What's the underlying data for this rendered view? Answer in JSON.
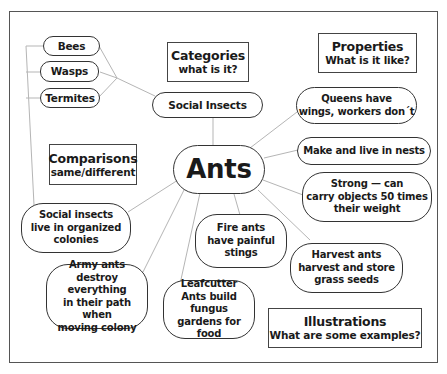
{
  "title": "Ants",
  "category_box": {
    "title": "Categories",
    "subtitle": "what is it?"
  },
  "properties_box": {
    "title": "Properties",
    "subtitle": "What is it like?"
  },
  "comparisons_box": {
    "title": "Comparisons",
    "subtitle": "same/different"
  },
  "illustrations_box": {
    "title": "Illustrations",
    "subtitle": "What are some examples?"
  },
  "category": "Social  Insects",
  "related_insects": [
    "Bees",
    "Wasps",
    "Termites"
  ],
  "properties": [
    [
      "Queens have",
      "wings, workers don´t"
    ],
    [
      "Make and live in nests"
    ],
    [
      "Strong — can",
      "carry objects 50 times",
      "their weight"
    ]
  ],
  "comparison": [
    "Social insects",
    "live in organized",
    "colonies"
  ],
  "illustrations": {
    "army": [
      "Army ants",
      "destroy everything",
      "in their path when",
      "moving colony"
    ],
    "leafcutter": [
      "Leafcutter",
      "Ants build fungus",
      "gardens for food"
    ],
    "fire": [
      "Fire ants",
      "have painful",
      "stings"
    ],
    "harvest": [
      "Harvest ants",
      "harvest and store",
      "grass seeds"
    ]
  },
  "colors": {
    "line": "#b5b5b5",
    "border": "#333333",
    "frame": "#555555"
  }
}
